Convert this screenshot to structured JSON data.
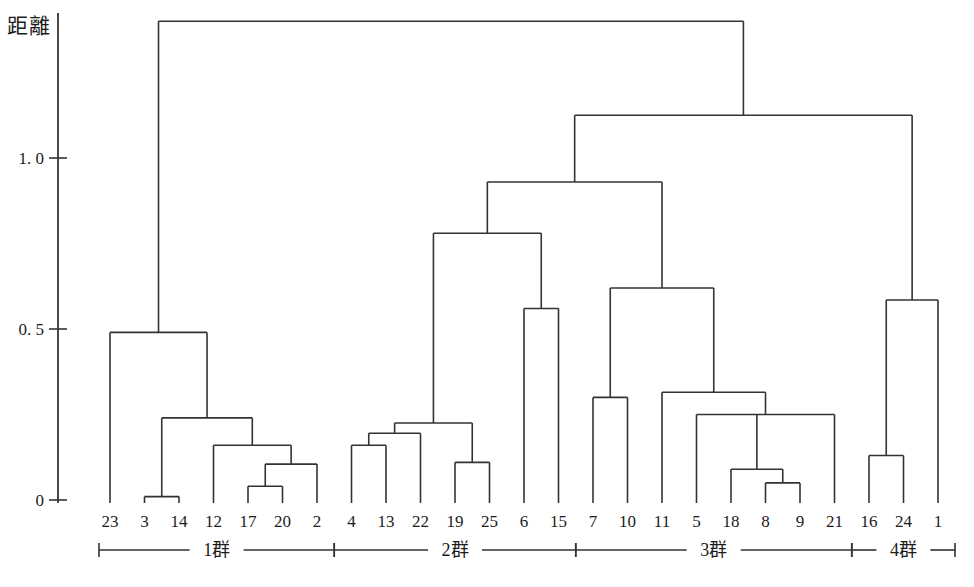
{
  "chart_data": {
    "type": "dendrogram",
    "title": "",
    "ylabel": "距離",
    "ylim": [
      0,
      1.45
    ],
    "yticks": [
      {
        "value": 0,
        "label": "0"
      },
      {
        "value": 0.5,
        "label": "0. 5"
      },
      {
        "value": 1.0,
        "label": "1. 0"
      }
    ],
    "grid": false,
    "leaves": [
      "23",
      "3",
      "14",
      "12",
      "17",
      "20",
      "2",
      "4",
      "13",
      "22",
      "19",
      "25",
      "6",
      "15",
      "7",
      "10",
      "11",
      "5",
      "18",
      "8",
      "9",
      "21",
      "16",
      "24",
      "1"
    ],
    "merges": [
      {
        "id": "m1",
        "children": [
          "3",
          "14"
        ],
        "height": 0.01
      },
      {
        "id": "m2",
        "children": [
          "17",
          "20"
        ],
        "height": 0.04
      },
      {
        "id": "m3",
        "children": [
          "m2",
          "2"
        ],
        "height": 0.105
      },
      {
        "id": "m4",
        "children": [
          "12",
          "m3"
        ],
        "height": 0.16
      },
      {
        "id": "m5",
        "children": [
          "m1",
          "m4"
        ],
        "height": 0.24
      },
      {
        "id": "m6",
        "children": [
          "23",
          "m5"
        ],
        "height": 0.49
      },
      {
        "id": "n1",
        "children": [
          "4",
          "13"
        ],
        "height": 0.16
      },
      {
        "id": "n2",
        "children": [
          "n1",
          "22"
        ],
        "height": 0.195
      },
      {
        "id": "n3",
        "children": [
          "19",
          "25"
        ],
        "height": 0.11
      },
      {
        "id": "n4",
        "children": [
          "n2",
          "n3"
        ],
        "height": 0.225
      },
      {
        "id": "n5",
        "children": [
          "6",
          "15"
        ],
        "height": 0.56
      },
      {
        "id": "n6",
        "children": [
          "n4",
          "n5"
        ],
        "height": 0.78
      },
      {
        "id": "p0",
        "children": [
          "7",
          "10"
        ],
        "height": 0.3
      },
      {
        "id": "p1",
        "children": [
          "8",
          "9"
        ],
        "height": 0.05
      },
      {
        "id": "p2",
        "children": [
          "18",
          "p1"
        ],
        "height": 0.09
      },
      {
        "id": "p3",
        "children": [
          "5",
          "p2",
          "21"
        ],
        "height": 0.25
      },
      {
        "id": "p4",
        "children": [
          "11",
          "p3"
        ],
        "height": 0.315
      },
      {
        "id": "p5",
        "children": [
          "p0",
          "p4"
        ],
        "height": 0.62
      },
      {
        "id": "q1",
        "children": [
          "16",
          "24"
        ],
        "height": 0.13
      },
      {
        "id": "q2",
        "children": [
          "q1",
          "1"
        ],
        "height": 0.585
      },
      {
        "id": "r1",
        "children": [
          "n6",
          "p5"
        ],
        "height": 0.93
      },
      {
        "id": "r2",
        "children": [
          "r1",
          "q2"
        ],
        "height": 1.125
      },
      {
        "id": "r3",
        "children": [
          "m6",
          "r2"
        ],
        "height": 1.4
      }
    ],
    "groups": [
      {
        "label": "1群",
        "leaves": [
          "23",
          "3",
          "14",
          "12",
          "17",
          "20",
          "2"
        ]
      },
      {
        "label": "2群",
        "leaves": [
          "4",
          "13",
          "22",
          "19",
          "25",
          "6",
          "15"
        ]
      },
      {
        "label": "3群",
        "leaves": [
          "7",
          "10",
          "11",
          "5",
          "18",
          "8",
          "9",
          "21"
        ]
      },
      {
        "label": "4群",
        "leaves": [
          "16",
          "24",
          "1"
        ]
      }
    ],
    "line_color": "#333333",
    "text_color": "#1c1c1c",
    "background": "#ffffff"
  }
}
